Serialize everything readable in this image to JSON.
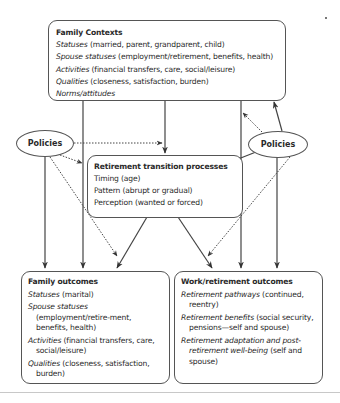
{
  "diagram": {
    "family_contexts": {
      "title": "Family Contexts",
      "rows": [
        {
          "term": "Statuses",
          "detail": " (married, parent, grandparent, child)"
        },
        {
          "term": "Spouse statuses",
          "detail": " (employment/retirement, benefits, health)"
        },
        {
          "term": "Activities",
          "detail": " (financial transfers, care, social/leisure)"
        },
        {
          "term": "Qualities",
          "detail": " (closeness, satisfaction, burden)"
        },
        {
          "term": "Norms/attitudes",
          "detail": ""
        }
      ]
    },
    "policies_left": {
      "label": "Policies"
    },
    "policies_right": {
      "label": "Policies"
    },
    "retirement_transition": {
      "title": "Retirement transition processes",
      "rows": [
        "Timing (age)",
        "Pattern (abrupt or gradual)",
        "Perception (wanted or forced)"
      ]
    },
    "family_outcomes": {
      "title": "Family outcomes",
      "rows": [
        {
          "term": "Statuses",
          "detail": " (marital)"
        },
        {
          "term": "Spouse statuses",
          "detail": " (employment/retire-ment, benefits, health)"
        },
        {
          "term": "Activities",
          "detail": " (financial transfers, care, social/leisure)"
        },
        {
          "term": "Qualities",
          "detail": " (closeness, satisfaction, burden)"
        }
      ]
    },
    "work_outcomes": {
      "title": "Work/retirement outcomes",
      "rows": [
        {
          "term": "Retirement pathways",
          "detail": " (continued, reentry)"
        },
        {
          "term": "Retirement benefits",
          "detail": " (social security, pensions—self and spouse)"
        },
        {
          "term": "Retirement adaptation and post-retirement well-being",
          "detail": " (self and spouse)"
        }
      ]
    },
    "edges": [
      {
        "from": "Family Contexts",
        "to": "Retirement transition processes",
        "style": "solid"
      },
      {
        "from": "Family Contexts",
        "to": "Family outcomes",
        "style": "solid"
      },
      {
        "from": "Family Contexts",
        "to": "Work/retirement outcomes",
        "style": "solid"
      },
      {
        "from": "Policies (left)",
        "to": "Family outcomes",
        "style": "solid"
      },
      {
        "from": "Policies (left)",
        "to": "Retirement transition processes",
        "style": "dotted"
      },
      {
        "from": "Policies (left)",
        "to": "Family Contexts line",
        "style": "dotted"
      },
      {
        "from": "Policies (left)",
        "to": "Family outcomes",
        "style": "dotted"
      },
      {
        "from": "Policies (right)",
        "to": "Family Contexts",
        "style": "solid"
      },
      {
        "from": "Policies (right)",
        "to": "Family Contexts line",
        "style": "dotted"
      },
      {
        "from": "Policies (right)",
        "to": "Retirement transition processes",
        "style": "solid"
      },
      {
        "from": "Policies (right)",
        "to": "Work/retirement outcomes",
        "style": "solid"
      },
      {
        "from": "Policies (right)",
        "to": "Work/retirement outcomes",
        "style": "dotted"
      },
      {
        "from": "Retirement transition processes",
        "to": "Family outcomes",
        "style": "solid"
      },
      {
        "from": "Retirement transition processes",
        "to": "Work/retirement outcomes",
        "style": "solid"
      }
    ]
  }
}
